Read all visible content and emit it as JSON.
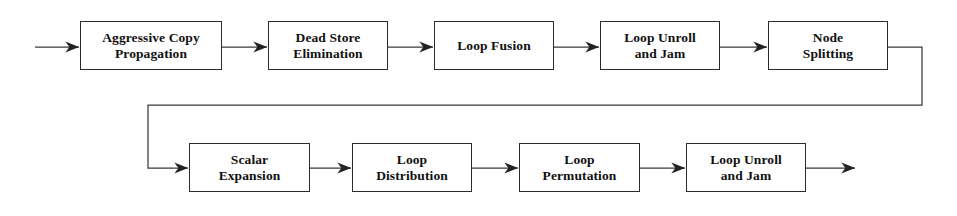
{
  "diagram": {
    "style": {
      "background": "#ffffff",
      "box_border_color": "#2b2b2b",
      "line_color": "#3a3a3a",
      "text_color": "#111111"
    },
    "rows": [
      {
        "name": "top-row",
        "nodes": [
          {
            "id": "aggressive-copy-propagation",
            "label": "Aggressive Copy\nPropagation",
            "x": 80,
            "y": 21,
            "w": 142,
            "h": 49
          },
          {
            "id": "dead-store-elimination",
            "label": "Dead Store\nElimination",
            "x": 268,
            "y": 21,
            "w": 120,
            "h": 49
          },
          {
            "id": "loop-fusion",
            "label": "Loop Fusion",
            "x": 434,
            "y": 21,
            "w": 120,
            "h": 49
          },
          {
            "id": "loop-unroll-and-jam-1",
            "label": "Loop Unroll\nand Jam",
            "x": 600,
            "y": 21,
            "w": 120,
            "h": 49
          },
          {
            "id": "node-splitting",
            "label": "Node\nSplitting",
            "x": 768,
            "y": 21,
            "w": 120,
            "h": 49
          }
        ]
      },
      {
        "name": "bottom-row",
        "nodes": [
          {
            "id": "scalar-expansion",
            "label": "Scalar\nExpansion",
            "x": 189,
            "y": 143,
            "w": 121,
            "h": 49
          },
          {
            "id": "loop-distribution",
            "label": "Loop\nDistribution",
            "x": 352,
            "y": 143,
            "w": 120,
            "h": 49
          },
          {
            "id": "loop-permutation",
            "label": "Loop\nPermutation",
            "x": 519,
            "y": 143,
            "w": 121,
            "h": 49
          },
          {
            "id": "loop-unroll-and-jam-2",
            "label": "Loop Unroll\nand Jam",
            "x": 686,
            "y": 143,
            "w": 120,
            "h": 49
          }
        ]
      }
    ],
    "connectors": [
      {
        "id": "entry-arrow",
        "from": "input",
        "to": "aggressive-copy-propagation",
        "arrow": true
      },
      {
        "id": "acp-to-dse",
        "from": "aggressive-copy-propagation",
        "to": "dead-store-elimination",
        "arrow": true
      },
      {
        "id": "dse-to-lf",
        "from": "dead-store-elimination",
        "to": "loop-fusion",
        "arrow": true
      },
      {
        "id": "lf-to-luj1",
        "from": "loop-fusion",
        "to": "loop-unroll-and-jam-1",
        "arrow": true
      },
      {
        "id": "luj1-to-ns",
        "from": "loop-unroll-and-jam-1",
        "to": "node-splitting",
        "arrow": true
      },
      {
        "id": "ns-wrap-to-se",
        "from": "node-splitting",
        "to": "scalar-expansion",
        "arrow": true
      },
      {
        "id": "se-to-ld",
        "from": "scalar-expansion",
        "to": "loop-distribution",
        "arrow": true
      },
      {
        "id": "ld-to-lp",
        "from": "loop-distribution",
        "to": "loop-permutation",
        "arrow": true
      },
      {
        "id": "lp-to-luj2",
        "from": "loop-permutation",
        "to": "loop-unroll-and-jam-2",
        "arrow": true
      },
      {
        "id": "exit-arrow",
        "from": "loop-unroll-and-jam-2",
        "to": "output",
        "arrow": true
      }
    ]
  }
}
